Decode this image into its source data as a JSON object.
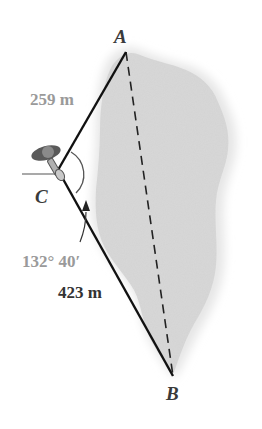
{
  "figure": {
    "points": {
      "A": {
        "label": "A",
        "x": 126,
        "y": 52
      },
      "B": {
        "label": "B",
        "x": 173,
        "y": 376
      },
      "C": {
        "label": "C",
        "x": 60,
        "y": 172
      }
    },
    "segments": [
      {
        "from": "C",
        "to": "A",
        "style": "solid",
        "length_label": "259 m"
      },
      {
        "from": "C",
        "to": "B",
        "style": "solid",
        "length_label": "423 m"
      },
      {
        "from": "A",
        "to": "B",
        "style": "dashed",
        "length_label": ""
      }
    ],
    "angle": {
      "vertex": "C",
      "label": "132° 40′"
    },
    "labels": {
      "A": "A",
      "B": "B",
      "C": "C",
      "CA_length": "259 m",
      "CB_length": "423 m",
      "angle_ACB": "132° 40′"
    },
    "colors": {
      "lake_fill": "#d9d9d9",
      "lake_halo": "#ececec",
      "line": "#111111",
      "grey_text": "#9a9a9a",
      "dark_text": "#333333"
    }
  }
}
